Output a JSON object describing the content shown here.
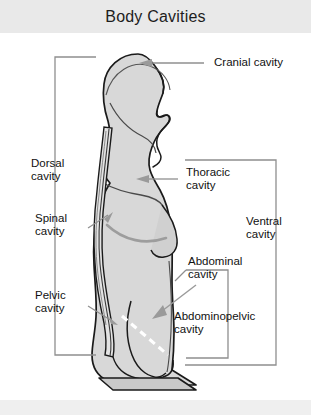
{
  "title": "Body Cavities",
  "diagram": {
    "type": "anatomical-lateral-view",
    "fill_color": "#d6d6d6",
    "outline_color": "#1a1a1a",
    "arrow_color": "#9a9a9a",
    "bracket_color": "#8c8c8c",
    "dashed_divider_color": "#ffffff"
  },
  "labels": {
    "cranial": "Cranial cavity",
    "dorsal_line1": "Dorsal",
    "dorsal_line2": "cavity",
    "spinal_line1": "Spinal",
    "spinal_line2": "cavity",
    "pelvic_line1": "Pelvic",
    "pelvic_line2": "cavity",
    "thoracic_line1": "Thoracic",
    "thoracic_line2": "cavity",
    "ventral_line1": "Ventral",
    "ventral_line2": "cavity",
    "abdominal_line1": "Abdominal",
    "abdominal_line2": "cavity",
    "abdominopelvic_line1": "Abdominopelvic",
    "abdominopelvic_line2": "cavity"
  },
  "cavity_list": [
    "Cranial cavity",
    "Spinal cavity",
    "Dorsal cavity",
    "Thoracic cavity",
    "Abdominal cavity",
    "Pelvic cavity",
    "Abdominopelvic cavity",
    "Ventral cavity"
  ]
}
